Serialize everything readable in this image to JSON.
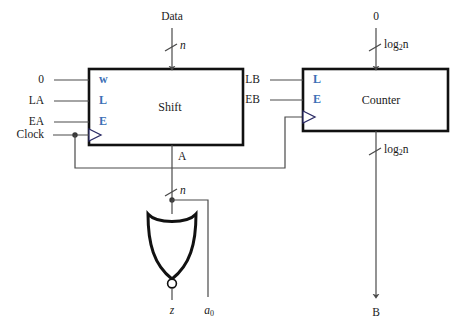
{
  "diagram": {
    "colors": {
      "wire": "#4a4a4a",
      "block_border": "#111111",
      "label_blue": "#3b6fb6",
      "text": "#1a1a1a",
      "background": "#ffffff"
    },
    "blocks": [
      {
        "name": "shift",
        "label": "Shift",
        "pin_labels": [
          "w",
          "L",
          "E"
        ],
        "top_input": {
          "source": "Data",
          "width": "n"
        },
        "left_inputs": [
          "0",
          "LA",
          "EA"
        ],
        "clock_input": "Clock",
        "output": {
          "label": "A",
          "width": "n"
        }
      },
      {
        "name": "counter",
        "label": "Counter",
        "pin_labels": [
          "L",
          "E"
        ],
        "top_input": {
          "source": "0",
          "width": "log2n"
        },
        "left_inputs": [
          "LB",
          "EB"
        ],
        "output": {
          "label": "B",
          "width": "log2n"
        }
      }
    ],
    "gate": {
      "type": "nor-gate",
      "orientation": "down",
      "output": "z",
      "tap_output": "a0"
    },
    "labels": {
      "data": "Data",
      "zero_left": "0",
      "la": "LA",
      "ea": "EA",
      "clock": "Clock",
      "shift": "Shift",
      "pin_w": "w",
      "pin_l": "L",
      "pin_e": "E",
      "bus_a": "A",
      "width_n_top": "n",
      "width_n_mid": "n",
      "zero_top_right": "0",
      "lb": "LB",
      "eb": "EB",
      "counter": "Counter",
      "counter_pin_l": "L",
      "counter_pin_e": "E",
      "bus_b": "B",
      "z_out": "z",
      "a0_out": "a",
      "a0_sub": "0",
      "log_base": "log",
      "log_sub": "2",
      "log_arg": "n"
    }
  }
}
